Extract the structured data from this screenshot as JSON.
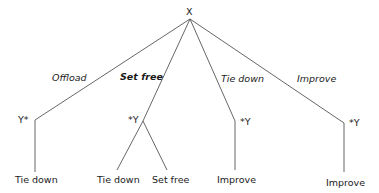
{
  "root": {
    "label": "X"
  },
  "edges": [
    {
      "label": "Offload",
      "bold": false
    },
    {
      "label": "Set free",
      "bold": true
    },
    {
      "label": "Tie down",
      "bold": false
    },
    {
      "label": "Improve",
      "bold": false
    }
  ],
  "nodes": [
    {
      "label": "Y*",
      "children": [
        "Tie down"
      ]
    },
    {
      "label": "*Y",
      "children": [
        "Tie down",
        "Set free"
      ]
    },
    {
      "label": "*Y",
      "children": [
        "Improve"
      ]
    },
    {
      "label": "*Y",
      "children": [
        "Improve"
      ]
    }
  ],
  "colors": {
    "line": "#555555",
    "text": "#1a1a1a"
  }
}
